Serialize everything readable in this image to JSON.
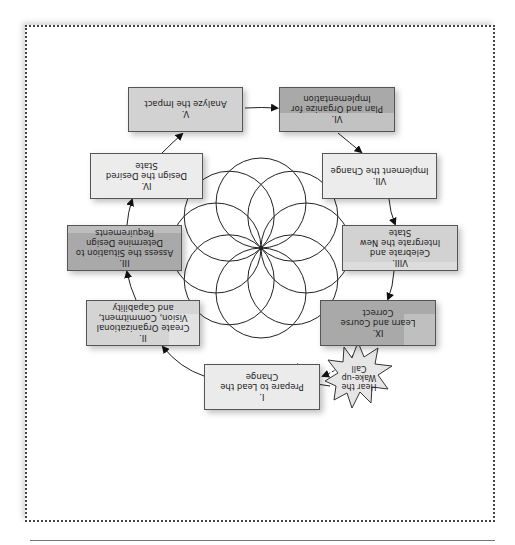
{
  "diagram": {
    "orientation": "rotated 180 degrees",
    "center_graphic": "eight-circle rosette",
    "start_node": {
      "id": "wake-up",
      "label": "Hear the Wake-up Call",
      "shape": "starburst"
    },
    "steps": [
      {
        "id": "I",
        "numeral": "I.",
        "label": "Prepare to Lead the Change",
        "fill": "#ebebeb"
      },
      {
        "id": "II",
        "numeral": "II.",
        "label": "Create Organizational Vision, Commitment, and Capability",
        "fill": "#d4d4d4"
      },
      {
        "id": "III",
        "numeral": "III.",
        "label": "Assess the Situation to Determine Design Requirements",
        "fill": "#a9a9a9"
      },
      {
        "id": "IV",
        "numeral": "IV.",
        "label": "Design the Desired State",
        "fill": "#ececec"
      },
      {
        "id": "V",
        "numeral": "V.",
        "label": "Analyze the Impact",
        "fill": "#d2d2d2"
      },
      {
        "id": "VI",
        "numeral": "VI.",
        "label": "Plan and Organize for Implementation",
        "fill": "#a9a9a9"
      },
      {
        "id": "VII",
        "numeral": "VII.",
        "label": "Implement the Change",
        "fill": "#ececec"
      },
      {
        "id": "VIII",
        "numeral": "VIII.",
        "label": "Celebrate and Intergrate the New State",
        "fill": "#d2d2d2"
      },
      {
        "id": "IX",
        "numeral": "IX.",
        "label": "Learn and Course Correct",
        "fill": "#a9a9a9"
      }
    ],
    "edges": [
      {
        "from": "wake-up",
        "to": "I",
        "style": "solid"
      },
      {
        "from": "I",
        "to": "II",
        "style": "solid"
      },
      {
        "from": "II",
        "to": "III",
        "style": "solid"
      },
      {
        "from": "III",
        "to": "IV",
        "style": "solid"
      },
      {
        "from": "IV",
        "to": "V",
        "style": "solid"
      },
      {
        "from": "V",
        "to": "VI",
        "style": "solid"
      },
      {
        "from": "VI",
        "to": "VII",
        "style": "solid"
      },
      {
        "from": "VII",
        "to": "VIII",
        "style": "solid"
      },
      {
        "from": "VIII",
        "to": "IX",
        "style": "solid"
      },
      {
        "from": "IX",
        "to": "I",
        "style": "dashed"
      }
    ]
  },
  "colors": {
    "border": "#444444",
    "box_border": "#555555",
    "light": "#ebebeb",
    "mid": "#d2d2d2",
    "dark": "#a9a9a9",
    "burst": "#e6e6e6"
  }
}
